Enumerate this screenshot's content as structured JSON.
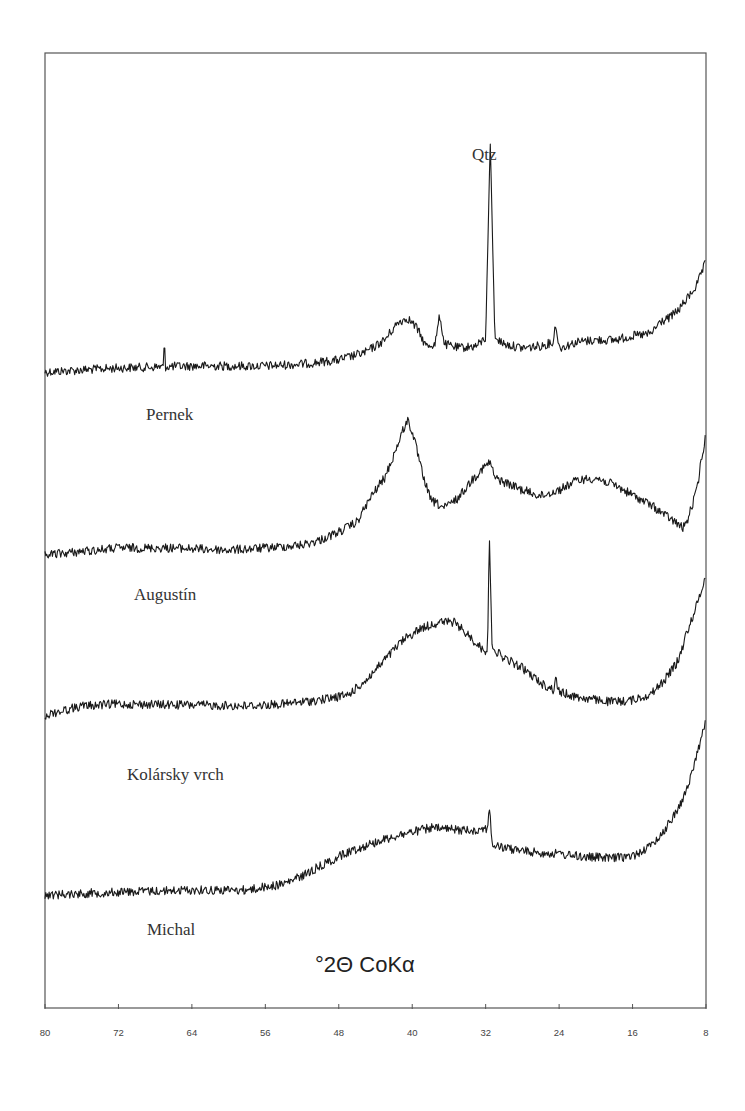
{
  "chart_data": {
    "type": "line",
    "title": "",
    "xlabel": "°2Θ CoKα",
    "ylabel": "",
    "x_axis_reversed": true,
    "xlim": [
      80,
      8
    ],
    "x_ticks": [
      80,
      72,
      64,
      56,
      48,
      40,
      32,
      24,
      16,
      8
    ],
    "x_tick_labels": [
      "80",
      "72",
      "64",
      "56",
      "48",
      "40",
      "32",
      "24",
      "16",
      "8"
    ],
    "grid": false,
    "legend": "none (series labels placed beneath each trace)",
    "annotations": [
      {
        "text": "Qtz",
        "x": 31.5,
        "series": "Pernek",
        "meaning": "quartz peak"
      }
    ],
    "series": [
      {
        "name": "Pernek",
        "label": "Pernek",
        "y_units": "relative (pixel offset)",
        "points": [
          [
            80,
            372
          ],
          [
            72,
            368
          ],
          [
            64,
            366
          ],
          [
            56,
            366
          ],
          [
            52,
            364
          ],
          [
            48,
            360
          ],
          [
            45,
            352
          ],
          [
            43,
            340
          ],
          [
            41.5,
            322
          ],
          [
            40.5,
            318
          ],
          [
            39.5,
            328
          ],
          [
            38.5,
            346
          ],
          [
            37.5,
            344
          ],
          [
            37,
            315
          ],
          [
            36.5,
            344
          ],
          [
            35,
            348
          ],
          [
            33,
            346
          ],
          [
            32,
            338
          ],
          [
            31.5,
            140
          ],
          [
            31,
            338
          ],
          [
            30,
            344
          ],
          [
            28,
            348
          ],
          [
            26,
            346
          ],
          [
            24.6,
            342
          ],
          [
            24.4,
            322
          ],
          [
            24,
            348
          ],
          [
            22,
            342
          ],
          [
            20,
            340
          ],
          [
            18,
            340
          ],
          [
            16,
            336
          ],
          [
            14,
            334
          ],
          [
            13,
            322
          ],
          [
            12,
            318
          ],
          [
            11,
            310
          ],
          [
            10,
            298
          ],
          [
            9,
            285
          ],
          [
            8,
            262
          ]
        ],
        "spikes": [
          [
            67,
            348
          ]
        ]
      },
      {
        "name": "Augustín",
        "label": "Augustín",
        "points": [
          [
            80,
            555
          ],
          [
            72,
            548
          ],
          [
            66,
            548
          ],
          [
            60,
            550
          ],
          [
            56,
            548
          ],
          [
            52,
            545
          ],
          [
            50,
            540
          ],
          [
            48,
            532
          ],
          [
            46,
            522
          ],
          [
            45,
            505
          ],
          [
            44,
            490
          ],
          [
            43,
            478
          ],
          [
            42,
            455
          ],
          [
            41,
            430
          ],
          [
            40.5,
            420
          ],
          [
            40,
            432
          ],
          [
            39.5,
            450
          ],
          [
            39,
            470
          ],
          [
            38,
            500
          ],
          [
            36.5,
            508
          ],
          [
            35,
            498
          ],
          [
            33.5,
            480
          ],
          [
            32.5,
            470
          ],
          [
            31.5,
            462
          ],
          [
            31,
            478
          ],
          [
            30,
            482
          ],
          [
            28,
            490
          ],
          [
            26,
            496
          ],
          [
            24,
            490
          ],
          [
            22,
            480
          ],
          [
            20,
            478
          ],
          [
            18,
            485
          ],
          [
            16,
            495
          ],
          [
            14,
            505
          ],
          [
            12,
            518
          ],
          [
            10.5,
            528
          ],
          [
            10,
            520
          ],
          [
            9,
            490
          ],
          [
            8.5,
            460
          ],
          [
            8,
            435
          ]
        ],
        "spikes": []
      },
      {
        "name": "Kolársky vrch",
        "label": "Kolársky vrch",
        "points": [
          [
            80,
            715
          ],
          [
            76,
            706
          ],
          [
            72,
            704
          ],
          [
            64,
            705
          ],
          [
            58,
            706
          ],
          [
            54,
            704
          ],
          [
            50,
            700
          ],
          [
            47,
            695
          ],
          [
            45,
            680
          ],
          [
            43,
            660
          ],
          [
            41,
            640
          ],
          [
            39,
            628
          ],
          [
            37,
            622
          ],
          [
            35.5,
            622
          ],
          [
            34,
            634
          ],
          [
            32.5,
            648
          ],
          [
            31.8,
            652
          ],
          [
            31.6,
            533
          ],
          [
            31.3,
            648
          ],
          [
            30,
            658
          ],
          [
            28,
            668
          ],
          [
            26,
            683
          ],
          [
            24.6,
            690
          ],
          [
            24.4,
            678
          ],
          [
            24,
            692
          ],
          [
            22,
            697
          ],
          [
            20,
            700
          ],
          [
            18,
            702
          ],
          [
            16,
            700
          ],
          [
            14,
            694
          ],
          [
            12.5,
            680
          ],
          [
            11,
            660
          ],
          [
            10,
            630
          ],
          [
            9,
            605
          ],
          [
            8,
            575
          ]
        ],
        "spikes": []
      },
      {
        "name": "Michal",
        "label": "Michal",
        "points": [
          [
            80,
            895
          ],
          [
            72,
            892
          ],
          [
            64,
            890
          ],
          [
            58,
            890
          ],
          [
            54,
            884
          ],
          [
            52,
            876
          ],
          [
            50,
            866
          ],
          [
            47,
            852
          ],
          [
            44,
            842
          ],
          [
            41,
            834
          ],
          [
            38,
            828
          ],
          [
            35,
            830
          ],
          [
            33,
            830
          ],
          [
            31.8,
            828
          ],
          [
            31.6,
            805
          ],
          [
            31.3,
            845
          ],
          [
            30,
            848
          ],
          [
            27,
            852
          ],
          [
            24,
            854
          ],
          [
            21,
            857
          ],
          [
            18,
            858
          ],
          [
            16,
            856
          ],
          [
            14,
            846
          ],
          [
            12.5,
            830
          ],
          [
            11,
            808
          ],
          [
            10,
            788
          ],
          [
            9,
            755
          ],
          [
            8,
            720
          ]
        ],
        "spikes": []
      }
    ]
  },
  "labels": {
    "qtz": "Qtz",
    "pernek": "Pernek",
    "augustin": "Augustín",
    "kolarsky": "Kolársky vrch",
    "michal": "Michal",
    "axis_title": "°2Θ CoKα"
  },
  "colors": {
    "trace": "#1a1a1a",
    "frame": "#555555",
    "text": "#333333",
    "background": "#ffffff"
  }
}
